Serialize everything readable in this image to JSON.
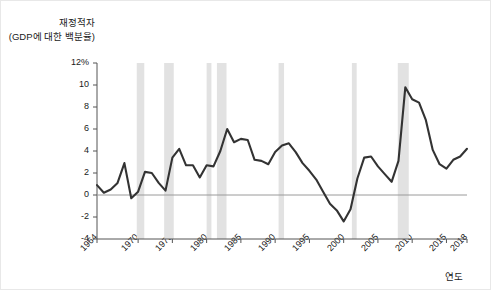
{
  "chart_data": {
    "type": "line",
    "title": "",
    "ylabel_line1": "재정적자",
    "ylabel_line2": "(GDP에 대한 백분율)",
    "xlabel": "연도",
    "xlim": [
      1964,
      2018
    ],
    "ylim": [
      -4,
      12
    ],
    "ytick_labels": [
      "12%",
      "10",
      "8",
      "6",
      "4",
      "2",
      "0",
      "-2",
      "-4"
    ],
    "ytick_values": [
      12,
      10,
      8,
      6,
      4,
      2,
      0,
      -2,
      -4
    ],
    "xtick_labels": [
      "1964",
      "1970",
      "1975",
      "1980",
      "1985",
      "1990",
      "1995",
      "2000",
      "2005",
      "2010",
      "2015",
      "2018"
    ],
    "xtick_values": [
      1964,
      1970,
      1975,
      1980,
      1985,
      1990,
      1995,
      2000,
      2005,
      2010,
      2015,
      2018
    ],
    "grid": false,
    "legend": "none",
    "line_color": "#333333",
    "band_color": "#e2e2e2",
    "zero_line_color": "#9a9a9a",
    "axis_color": "#555555",
    "series": [
      {
        "name": "재정적자 (GDP 대비 %)",
        "x": [
          1964,
          1965,
          1966,
          1967,
          1968,
          1969,
          1970,
          1971,
          1972,
          1973,
          1974,
          1975,
          1976,
          1977,
          1978,
          1979,
          1980,
          1981,
          1982,
          1983,
          1984,
          1985,
          1986,
          1987,
          1988,
          1989,
          1990,
          1991,
          1992,
          1993,
          1994,
          1995,
          1996,
          1997,
          1998,
          1999,
          2000,
          2001,
          2002,
          2003,
          2004,
          2005,
          2006,
          2007,
          2008,
          2009,
          2010,
          2011,
          2012,
          2013,
          2014,
          2015,
          2016,
          2017,
          2018
        ],
        "values": [
          0.9,
          0.2,
          0.5,
          1.1,
          2.9,
          -0.3,
          0.3,
          2.1,
          2.0,
          1.1,
          0.4,
          3.4,
          4.2,
          2.7,
          2.7,
          1.6,
          2.7,
          2.6,
          4.0,
          6.0,
          4.8,
          5.1,
          5.0,
          3.2,
          3.1,
          2.8,
          3.9,
          4.5,
          4.7,
          3.9,
          2.9,
          2.2,
          1.4,
          0.3,
          -0.8,
          -1.4,
          -2.4,
          -1.3,
          1.5,
          3.4,
          3.5,
          2.6,
          1.9,
          1.2,
          3.1,
          9.8,
          8.7,
          8.4,
          6.8,
          4.1,
          2.8,
          2.4,
          3.2,
          3.5,
          4.2
        ]
      }
    ],
    "recession_bands": [
      {
        "start": 1969.8,
        "end": 1970.9
      },
      {
        "start": 1973.8,
        "end": 1975.2
      },
      {
        "start": 1980.0,
        "end": 1980.7
      },
      {
        "start": 1981.5,
        "end": 1982.9
      },
      {
        "start": 1990.5,
        "end": 1991.3
      },
      {
        "start": 2001.2,
        "end": 2001.9
      },
      {
        "start": 2007.9,
        "end": 2009.5
      }
    ]
  }
}
